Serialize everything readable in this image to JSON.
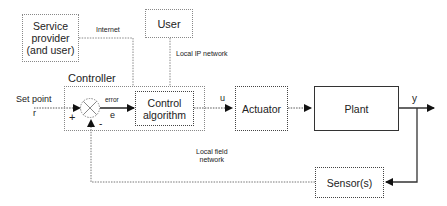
{
  "diagram": {
    "type": "control-system-block-diagram",
    "nodes": {
      "service_provider": "Service provider (and user)",
      "service_provider_line1": "Service",
      "service_provider_line2": "provider",
      "service_provider_line3": "(and user)",
      "user": "User",
      "controller": "Controller",
      "control_algorithm_line1": "Control",
      "control_algorithm_line2": "algorithm",
      "actuator": "Actuator",
      "plant": "Plant",
      "sensor": "Sensor(s)"
    },
    "edge_labels": {
      "internet": "Internet",
      "local_ip_network": "Local IP network",
      "local_field_network_line1": "Local field",
      "local_field_network_line2": "network",
      "set_point": "Set point",
      "r": "r",
      "error": "error",
      "e": "e",
      "u": "u",
      "y": "y",
      "plus": "+",
      "minus": "-"
    },
    "edges": [
      {
        "from": "Service provider",
        "to": "Controller",
        "label": "Internet",
        "style": "dotted"
      },
      {
        "from": "User",
        "to": "Controller",
        "label": "Local IP network",
        "style": "dotted"
      },
      {
        "from": "Set point r",
        "to": "Summing junction",
        "sign": "+",
        "style": "dotted"
      },
      {
        "from": "Summing junction",
        "to": "Control algorithm",
        "label": "error e",
        "style": "solid"
      },
      {
        "from": "Control algorithm",
        "to": "Actuator",
        "label": "u",
        "style": "dotted"
      },
      {
        "from": "Actuator",
        "to": "Plant",
        "style": "dotted"
      },
      {
        "from": "Plant",
        "to": "Output",
        "label": "y",
        "style": "solid"
      },
      {
        "from": "Plant output",
        "to": "Sensor(s)",
        "style": "solid"
      },
      {
        "from": "Sensor(s)",
        "to": "Summing junction",
        "sign": "-",
        "label": "Local field network",
        "style": "dotted"
      }
    ]
  }
}
